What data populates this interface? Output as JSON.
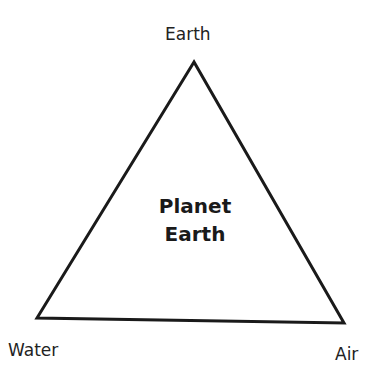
{
  "diagram": {
    "type": "triangle",
    "center_label": {
      "line1": "Planet",
      "line2": "Earth"
    },
    "vertices": {
      "top": "Earth",
      "bottom_left": "Water",
      "bottom_right": "Air"
    },
    "stroke_color": "#1a1a1a"
  }
}
